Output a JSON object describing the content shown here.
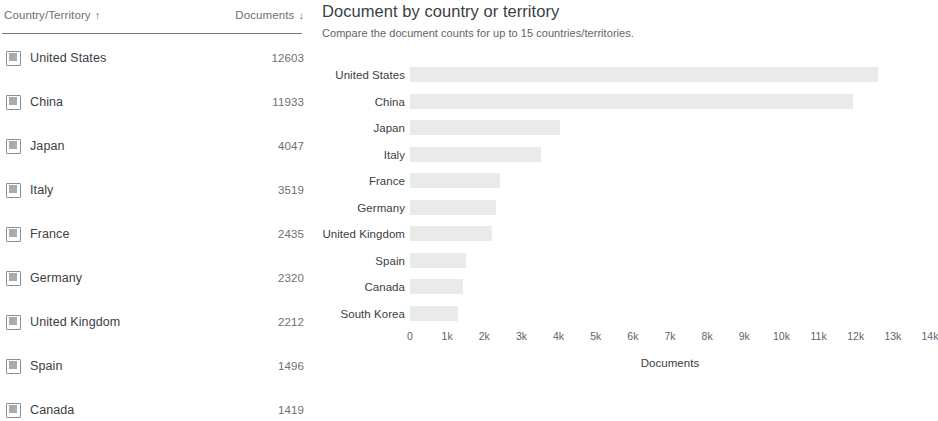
{
  "table": {
    "header": {
      "country_label": "Country/Territory",
      "country_sort_icon": "sort-ascending-arrow-icon",
      "country_sort_glyph": "↑",
      "documents_label": "Documents",
      "documents_sort_icon": "sort-descending-arrow-icon",
      "documents_sort_glyph": "↓"
    },
    "rows": [
      {
        "name": "United States",
        "documents": "12603"
      },
      {
        "name": "China",
        "documents": "11933"
      },
      {
        "name": "Japan",
        "documents": "4047"
      },
      {
        "name": "Italy",
        "documents": "3519"
      },
      {
        "name": "France",
        "documents": "2435"
      },
      {
        "name": "Germany",
        "documents": "2320"
      },
      {
        "name": "United Kingdom",
        "documents": "2212"
      },
      {
        "name": "Spain",
        "documents": "1496"
      },
      {
        "name": "Canada",
        "documents": "1419"
      }
    ]
  },
  "chart": {
    "title": "Document by country or territory",
    "subtitle": "Compare the document counts for up to 15 countries/territories.",
    "bar_color": "#e9eaea"
  },
  "chart_data": {
    "type": "bar",
    "orientation": "horizontal",
    "title": "Document by country or territory",
    "subtitle": "Compare the document counts for up to 15 countries/territories.",
    "xlabel": "Documents",
    "ylabel": "",
    "xlim": [
      0,
      14000
    ],
    "grid": false,
    "legend": null,
    "tick_labels": [
      "0",
      "1k",
      "2k",
      "3k",
      "4k",
      "5k",
      "6k",
      "7k",
      "8k",
      "9k",
      "10k",
      "11k",
      "12k",
      "13k",
      "14k"
    ],
    "tick_values": [
      0,
      1000,
      2000,
      3000,
      4000,
      5000,
      6000,
      7000,
      8000,
      9000,
      10000,
      11000,
      12000,
      13000,
      14000
    ],
    "categories": [
      "United States",
      "China",
      "Japan",
      "Italy",
      "France",
      "Germany",
      "United Kingdom",
      "Spain",
      "Canada",
      "South Korea"
    ],
    "values": [
      12603,
      11933,
      4047,
      3519,
      2435,
      2320,
      2212,
      1496,
      1419,
      1300
    ]
  }
}
